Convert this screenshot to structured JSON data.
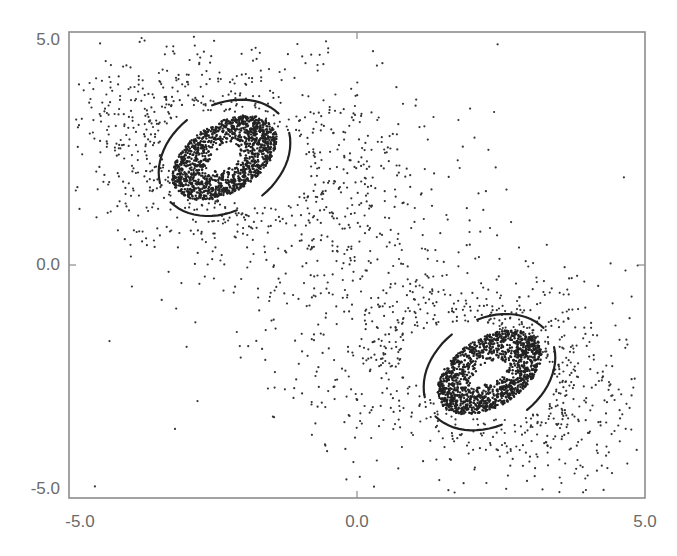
{
  "chart_data": {
    "type": "scatter",
    "title": "",
    "xlabel": "",
    "ylabel": "",
    "xlim": [
      -5.0,
      5.0
    ],
    "ylim": [
      -5.0,
      5.0
    ],
    "grid": false,
    "legend": null,
    "x_ticks": [
      "-5.0",
      "0.0",
      "5.0"
    ],
    "y_ticks": [
      "5.0",
      "0.0",
      "-5.0"
    ],
    "point_color": "#333333",
    "frame_color": "#8c8c8c",
    "tick_label_color": "#6b6b6b",
    "symmetry": "point-symmetric about origin",
    "series": [
      {
        "name": "upper-left cluster",
        "center": [
          -2.3,
          2.3
        ],
        "core_orientation_deg": -32,
        "core_semi_axes": [
          1.0,
          0.6
        ],
        "hole_semi_axes": [
          0.22,
          0.14
        ],
        "scatter_extent_x": [
          -4.5,
          1.3
        ],
        "scatter_extent_y": [
          -1.2,
          4.5
        ],
        "scatter_point_count": 900,
        "core_point_count": 1400,
        "crescent_arms": 4
      },
      {
        "name": "lower-right cluster",
        "center": [
          2.3,
          -2.3
        ],
        "core_orientation_deg": -32,
        "core_semi_axes": [
          1.0,
          0.6
        ],
        "hole_semi_axes": [
          0.22,
          0.14
        ],
        "scatter_extent_x": [
          -1.3,
          4.5
        ],
        "scatter_extent_y": [
          -4.5,
          1.2
        ],
        "scatter_point_count": 900,
        "core_point_count": 1400,
        "crescent_arms": 4
      }
    ],
    "outliers": [
      [
        -4.55,
        -4.75
      ]
    ]
  },
  "axes": {
    "y_tick_labels": [
      "5.0",
      "0.0",
      "-5.0"
    ],
    "x_tick_labels": [
      "-5.0",
      "0.0",
      "5.0"
    ]
  },
  "caption": ""
}
